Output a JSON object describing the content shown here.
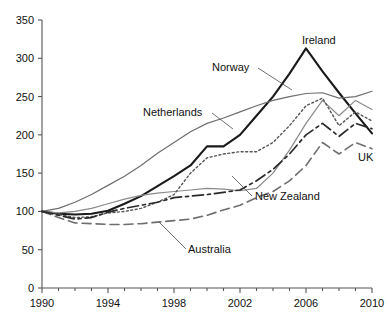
{
  "chart_data": {
    "type": "line",
    "title": "",
    "subtitle": "",
    "xlabel": "",
    "ylabel": "",
    "xlim": [
      1990,
      2010
    ],
    "ylim": [
      0,
      350
    ],
    "grid": false,
    "legend_position": "inline-annotations",
    "yticks": [
      0,
      50,
      100,
      150,
      200,
      250,
      300,
      350
    ],
    "xticks": [
      1990,
      1994,
      1998,
      2002,
      2006,
      2010
    ],
    "xticks_minor": [
      1991,
      1992,
      1993,
      1995,
      1996,
      1997,
      1999,
      2000,
      2001,
      2003,
      2004,
      2005,
      2007,
      2008,
      2009
    ],
    "x": [
      1990,
      1991,
      1992,
      1993,
      1994,
      1995,
      1996,
      1997,
      1998,
      1999,
      2000,
      2001,
      2002,
      2003,
      2004,
      2005,
      2006,
      2007,
      2008,
      2009,
      2010
    ],
    "series": [
      {
        "name": "Ireland",
        "style": "solid-thick",
        "color": "#1a1a1a",
        "width": 2.1,
        "dash": "none",
        "values": [
          100,
          97,
          96,
          97,
          101,
          110,
          120,
          133,
          146,
          160,
          185,
          185,
          200,
          225,
          250,
          280,
          313,
          283,
          255,
          228,
          202
        ]
      },
      {
        "name": "Norway",
        "style": "solid-thin",
        "color": "#6e6e6e",
        "width": 1.2,
        "dash": "none",
        "values": [
          100,
          104,
          112,
          122,
          134,
          146,
          160,
          176,
          190,
          204,
          215,
          222,
          230,
          238,
          245,
          250,
          254,
          255,
          248,
          250,
          257
        ]
      },
      {
        "name": "Netherlands",
        "style": "solid-thin-grey",
        "color": "#8a8a8a",
        "width": 1.2,
        "dash": "none",
        "values": [
          100,
          98,
          100,
          104,
          110,
          116,
          121,
          124,
          126,
          128,
          130,
          129,
          127,
          130,
          150,
          180,
          215,
          245,
          225,
          245,
          233
        ]
      },
      {
        "name": "UK",
        "style": "dashed-long",
        "color": "#6e6e6e",
        "width": 1.6,
        "dash": "9,5",
        "values": [
          100,
          92,
          85,
          84,
          83,
          83,
          84,
          86,
          88,
          90,
          95,
          102,
          108,
          118,
          126,
          140,
          160,
          190,
          175,
          190,
          182
        ]
      },
      {
        "name": "New Zealand",
        "style": "dotted-fine",
        "color": "#555555",
        "width": 1.4,
        "dash": "2,2.5",
        "values": [
          100,
          96,
          92,
          93,
          98,
          100,
          104,
          112,
          122,
          150,
          170,
          175,
          178,
          178,
          190,
          212,
          238,
          248,
          212,
          230,
          218
        ]
      },
      {
        "name": "Australia",
        "style": "dash-dot",
        "color": "#2a2a2a",
        "width": 1.7,
        "dash": "11,4,3,4",
        "values": [
          100,
          95,
          90,
          92,
          99,
          104,
          108,
          112,
          118,
          120,
          122,
          125,
          128,
          140,
          155,
          175,
          200,
          215,
          198,
          215,
          208
        ]
      }
    ],
    "annotations": [
      {
        "label": "Ireland",
        "x": 302,
        "y": 44,
        "anchor": "start",
        "leader": null
      },
      {
        "label": "Norway",
        "x": 212,
        "y": 71,
        "anchor": "start",
        "leader": {
          "x1": 258,
          "y1": 68,
          "x2": 292,
          "y2": 90
        }
      },
      {
        "label": "Netherlands",
        "x": 143,
        "y": 116,
        "anchor": "start",
        "leader": {
          "x1": 212,
          "y1": 113,
          "x2": 233,
          "y2": 129
        }
      },
      {
        "label": "UK",
        "x": 358,
        "y": 161,
        "anchor": "start",
        "leader": null
      },
      {
        "label": "New Zealand",
        "x": 255,
        "y": 200,
        "anchor": "start",
        "leader": {
          "x1": 252,
          "y1": 196,
          "x2": 232,
          "y2": 176
        }
      },
      {
        "label": "Australia",
        "x": 188,
        "y": 253,
        "anchor": "start",
        "leader": {
          "x1": 186,
          "y1": 249,
          "x2": 159,
          "y2": 222
        }
      }
    ]
  },
  "axes": {
    "y_labels": [
      "0",
      "50",
      "100",
      "150",
      "200",
      "250",
      "300",
      "350"
    ],
    "x_labels": [
      "1990",
      "1994",
      "1998",
      "2002",
      "2006",
      "2010"
    ]
  }
}
